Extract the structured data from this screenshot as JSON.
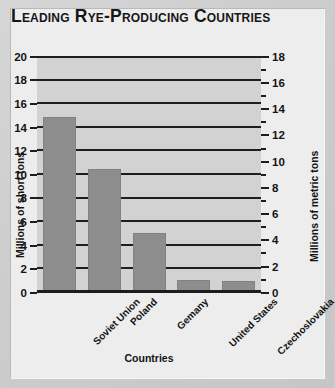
{
  "title": "Leading Rye-Producing Countries",
  "chart_data": {
    "type": "bar",
    "title": "Leading Rye-Producing Countries",
    "xlabel": "Countries",
    "ylabel": "Millions of short tons",
    "ylabel_secondary": "Millions of metric tons",
    "categories": [
      "Soviet Union",
      "Poland",
      "Gemany",
      "United States",
      "Czechoslovakia"
    ],
    "values": [
      14.8,
      10.4,
      5.0,
      1.0,
      0.9
    ],
    "ylim": [
      0,
      20
    ],
    "yticks": [
      0,
      2,
      4,
      6,
      8,
      10,
      12,
      14,
      16,
      18,
      20
    ],
    "ylim_secondary": [
      0,
      18
    ],
    "yticks_secondary": [
      0,
      2,
      4,
      6,
      8,
      10,
      12,
      14,
      16,
      18
    ],
    "yticks_secondary_minor": [
      1,
      3,
      5,
      7,
      9,
      11,
      13,
      15,
      17
    ],
    "grid": true,
    "legend": false,
    "bar_color": "#8d8d8d",
    "plot_background": "#d2d2d2",
    "axis_color": "#1d1d1d"
  }
}
